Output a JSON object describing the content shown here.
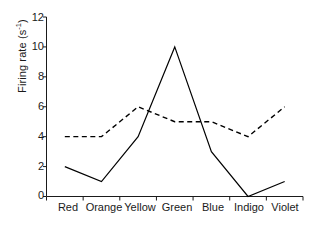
{
  "chart_data": {
    "type": "line",
    "title": "",
    "xlabel": "",
    "ylabel": "Firing rate (s⁻¹)",
    "ylabel_base": "Firing rate (s",
    "ylabel_exp": "-1",
    "ylabel_close": ")",
    "categories": [
      "Red",
      "Orange",
      "Yellow",
      "Green",
      "Blue",
      "Indigo",
      "Violet"
    ],
    "ylim": [
      0,
      12
    ],
    "yticks": [
      0,
      2,
      4,
      6,
      8,
      10,
      12
    ],
    "ytick_labels": [
      "0",
      "2",
      "4",
      "6",
      "8",
      "10",
      "12"
    ],
    "grid": false,
    "legend": "none",
    "series": [
      {
        "name": "solid",
        "style": "solid",
        "color": "#000000",
        "values": [
          2,
          1,
          4,
          10,
          3,
          0,
          1
        ]
      },
      {
        "name": "dashed",
        "style": "dashed",
        "color": "#000000",
        "values": [
          4,
          4,
          6,
          5,
          5,
          4,
          6
        ]
      }
    ]
  }
}
